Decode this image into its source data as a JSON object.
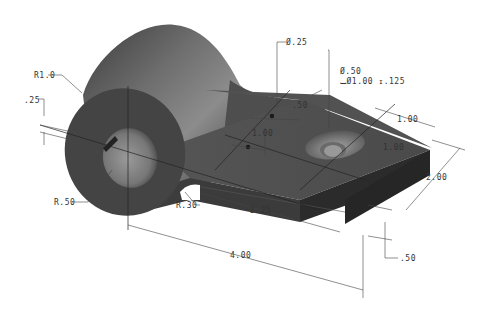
{
  "drawing": {
    "title": "Isometric part with cylindrical boss and rectangular plate",
    "dimensions": {
      "boss_radius": "R1.0",
      "slot_width": ".25",
      "bore_radius": "R.50",
      "fillet_radius": "R.30",
      "small_hole_dia": "Ø.25",
      "small_hole_offset_y": ".50",
      "small_hole_offset_x": "1.00",
      "cbore_hole_dia": "Ø.50",
      "cbore_spec": "⌴Ø1.00 ↧.125",
      "cbore_from_end": "1.00",
      "cbore_from_side": "1.00",
      "plate_width": "2.00",
      "hole_to_center": "2.25",
      "overall_length": "4.00",
      "plate_thickness": ".50"
    },
    "colors": {
      "part_top": "#5a5a5a",
      "part_side": "#3a3a3a",
      "part_end": "#2a2a2a",
      "cylinder_light": "#8a8a8a",
      "cylinder_dark": "#3d3d3d",
      "dimension_text": "#333333"
    }
  }
}
